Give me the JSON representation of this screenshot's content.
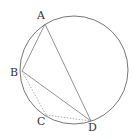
{
  "diagram": {
    "type": "inscribed-quadrilateral",
    "circle": {
      "cx": 74,
      "cy": 70,
      "r": 54,
      "stroke": "#666666"
    },
    "points": [
      {
        "name": "A",
        "x": 45,
        "y": 24,
        "label_x": 37,
        "label_y": 19
      },
      {
        "name": "B",
        "x": 22,
        "y": 71,
        "label_x": 10,
        "label_y": 76
      },
      {
        "name": "C",
        "x": 46,
        "y": 115,
        "label_x": 37,
        "label_y": 125
      },
      {
        "name": "D",
        "x": 91,
        "y": 121,
        "label_x": 88,
        "label_y": 131
      }
    ],
    "solid_segments": [
      [
        "A",
        "B"
      ],
      [
        "A",
        "D"
      ],
      [
        "B",
        "D"
      ]
    ],
    "dashed_segments": [
      [
        "B",
        "C"
      ],
      [
        "C",
        "D"
      ]
    ],
    "line_color": "#777777"
  },
  "labels": {
    "A": "A",
    "B": "B",
    "C": "C",
    "D": "D"
  }
}
